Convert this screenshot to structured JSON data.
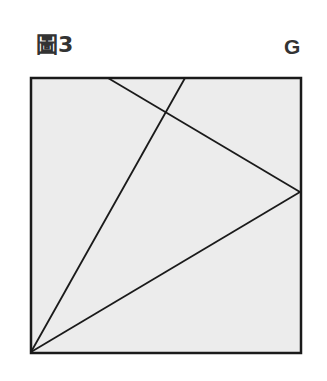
{
  "figure": {
    "label": "圖3",
    "corner_label": "G"
  },
  "diagram": {
    "square": {
      "x": 31,
      "y": 78,
      "width": 270,
      "height": 275,
      "fill": "#ececec",
      "stroke": "#1a1a1a"
    },
    "lines": [
      {
        "name": "top-edge-to-right-vertex",
        "x1": 108,
        "y1": 78,
        "x2": 300,
        "y2": 192
      },
      {
        "name": "bottom-left-to-top-edge",
        "x1": 31,
        "y1": 352,
        "x2": 185,
        "y2": 78
      },
      {
        "name": "bottom-left-to-right-vertex",
        "x1": 31,
        "y1": 352,
        "x2": 300,
        "y2": 192
      }
    ],
    "line_color": "#1a1a1a"
  }
}
